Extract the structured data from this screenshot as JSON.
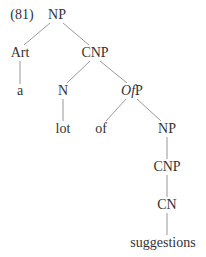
{
  "example_number": "(81)",
  "tree": {
    "nodes": [
      {
        "id": "np1",
        "label": "NP",
        "x": 57,
        "y": 15
      },
      {
        "id": "art",
        "label": "Art",
        "x": 20,
        "y": 53
      },
      {
        "id": "cnp1",
        "label": "CNP",
        "x": 95,
        "y": 53
      },
      {
        "id": "a",
        "label": "a",
        "x": 20,
        "y": 91
      },
      {
        "id": "n",
        "label": "N",
        "x": 63,
        "y": 91
      },
      {
        "id": "ofp",
        "label_italic": "Of",
        "label_rest": "P",
        "x": 132,
        "y": 91
      },
      {
        "id": "lot",
        "label": "lot",
        "x": 63,
        "y": 129
      },
      {
        "id": "of",
        "label": "of",
        "x": 101,
        "y": 129
      },
      {
        "id": "np2",
        "label": "NP",
        "x": 167,
        "y": 129
      },
      {
        "id": "cnp2",
        "label": "CNP",
        "x": 167,
        "y": 167
      },
      {
        "id": "cn",
        "label": "CN",
        "x": 167,
        "y": 205
      },
      {
        "id": "suggestions",
        "label": "suggestions",
        "x": 163,
        "y": 243
      }
    ],
    "edges": [
      [
        "np1",
        "art"
      ],
      [
        "np1",
        "cnp1"
      ],
      [
        "art",
        "a"
      ],
      [
        "cnp1",
        "n"
      ],
      [
        "cnp1",
        "ofp"
      ],
      [
        "n",
        "lot"
      ],
      [
        "ofp",
        "of"
      ],
      [
        "ofp",
        "np2"
      ],
      [
        "np2",
        "cnp2"
      ],
      [
        "cnp2",
        "cn"
      ],
      [
        "cn",
        "suggestions"
      ]
    ]
  },
  "labels": {
    "example_number": "(81)",
    "np_root": "NP",
    "art": "Art",
    "cnp_1": "CNP",
    "a": "a",
    "n": "N",
    "ofp_italic": "Of",
    "ofp_rest": "P",
    "lot": "lot",
    "of": "of",
    "np_2": "NP",
    "cnp_2": "CNP",
    "cn": "CN",
    "suggestions": "suggestions"
  }
}
